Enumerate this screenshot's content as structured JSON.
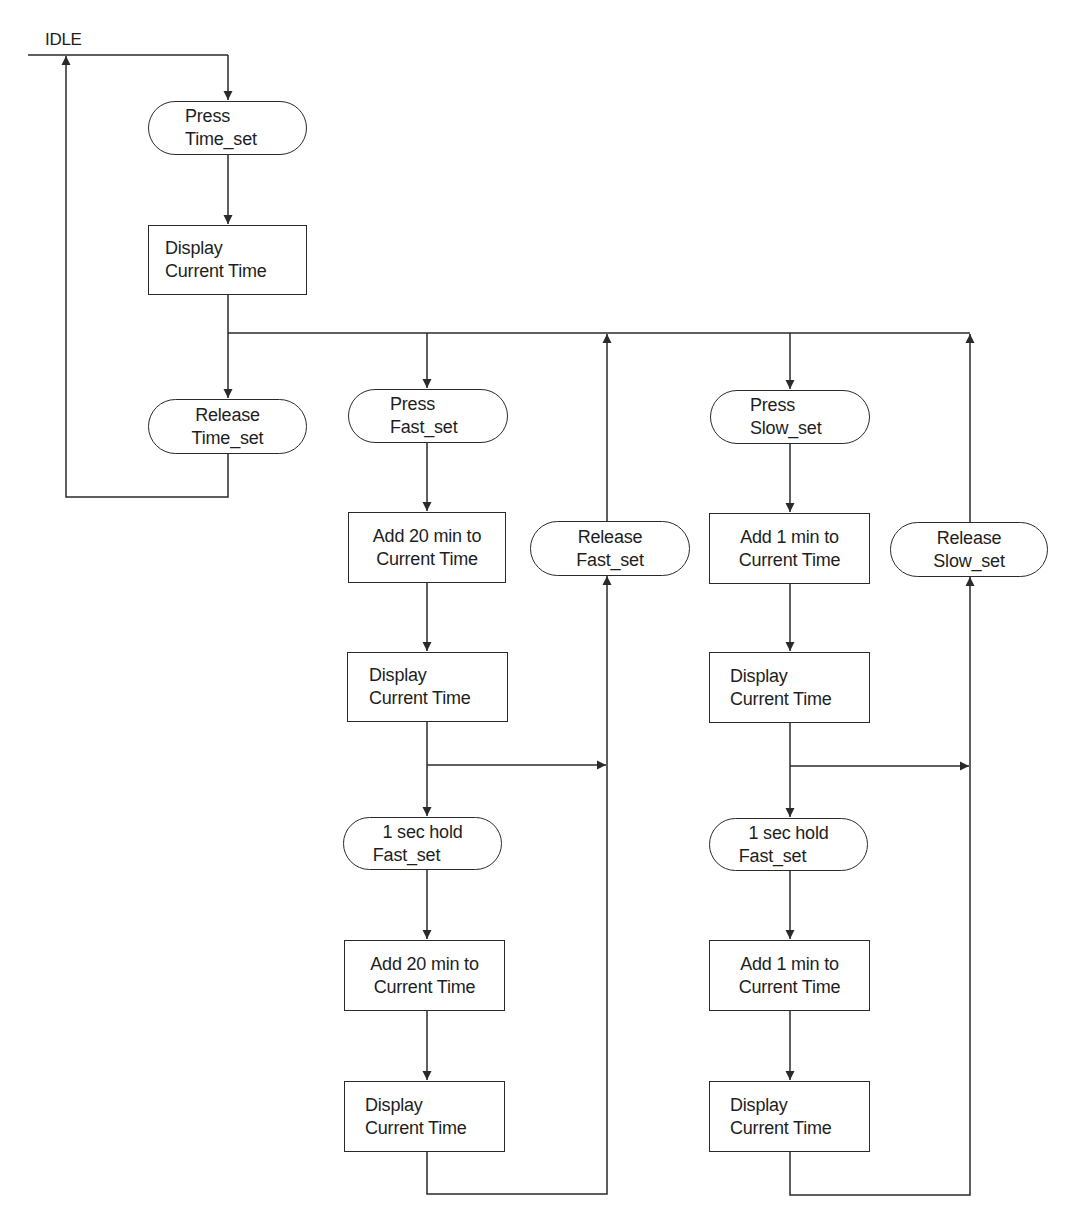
{
  "diagram": {
    "type": "flowchart",
    "title_cutoff_visible": false,
    "start_label": "IDLE",
    "colors": {
      "line": "#2a2a2a",
      "text": "#1e1e1e",
      "background": "#ffffff"
    },
    "time_set_column": {
      "press": {
        "shape": "terminator",
        "lines": [
          "Press",
          "Time_set"
        ]
      },
      "display": {
        "shape": "process",
        "lines": [
          "Display",
          "Current Time"
        ]
      },
      "release": {
        "shape": "terminator",
        "lines": [
          "Release",
          "Time_set"
        ]
      }
    },
    "fast_set_column": {
      "press": {
        "shape": "terminator",
        "lines": [
          "Press",
          "Fast_set"
        ]
      },
      "add_1": {
        "shape": "process",
        "lines": [
          "Add 20 min to",
          "Current Time"
        ]
      },
      "display_1": {
        "shape": "process",
        "lines": [
          "Display",
          "Current Time"
        ]
      },
      "hold": {
        "shape": "terminator",
        "lines": [
          "1 sec hold",
          "Fast_set"
        ]
      },
      "add_2": {
        "shape": "process",
        "lines": [
          "Add 20 min to",
          "Current Time"
        ]
      },
      "display_2": {
        "shape": "process",
        "lines": [
          "Display",
          "Current Time"
        ]
      },
      "release": {
        "shape": "terminator",
        "lines": [
          "Release",
          "Fast_set"
        ]
      }
    },
    "slow_set_column": {
      "press": {
        "shape": "terminator",
        "lines": [
          "Press",
          "Slow_set"
        ]
      },
      "add_1": {
        "shape": "process",
        "lines": [
          "Add 1 min to",
          "Current Time"
        ]
      },
      "display_1": {
        "shape": "process",
        "lines": [
          "Display",
          "Current Time"
        ]
      },
      "hold": {
        "shape": "terminator",
        "lines": [
          "1 sec hold",
          "Fast_set"
        ]
      },
      "add_2": {
        "shape": "process",
        "lines": [
          "Add 1 min to",
          "Current Time"
        ]
      },
      "display_2": {
        "shape": "process",
        "lines": [
          "Display",
          "Current Time"
        ]
      },
      "release": {
        "shape": "terminator",
        "lines": [
          "Release",
          "Slow_set"
        ]
      }
    },
    "edges": [
      {
        "from": "IDLE",
        "to": "Press Time_set"
      },
      {
        "from": "Press Time_set",
        "to": "Display Current Time"
      },
      {
        "from": "Display Current Time",
        "to": "Release Time_set"
      },
      {
        "from": "Display Current Time",
        "to": "Press Fast_set"
      },
      {
        "from": "Display Current Time",
        "to": "Press Slow_set"
      },
      {
        "from": "Release Time_set",
        "to": "IDLE"
      },
      {
        "from": "Press Fast_set",
        "to": "Add 20 min to Current Time"
      },
      {
        "from": "Add 20 min to Current Time",
        "to": "Display Current Time (fast 1)"
      },
      {
        "from": "Display Current Time (fast 1)",
        "to": "1 sec hold Fast_set"
      },
      {
        "from": "Display Current Time (fast 1)",
        "to": "Release Fast_set"
      },
      {
        "from": "1 sec hold Fast_set",
        "to": "Add 20 min to Current Time (2)"
      },
      {
        "from": "Add 20 min to Current Time (2)",
        "to": "Display Current Time (fast 2)"
      },
      {
        "from": "Display Current Time (fast 2)",
        "to": "Release Fast_set"
      },
      {
        "from": "Release Fast_set",
        "to": "bus (Display Current Time)"
      },
      {
        "from": "Press Slow_set",
        "to": "Add 1 min to Current Time"
      },
      {
        "from": "Add 1 min to Current Time",
        "to": "Display Current Time (slow 1)"
      },
      {
        "from": "Display Current Time (slow 1)",
        "to": "1 sec hold Fast_set (slow column)"
      },
      {
        "from": "Display Current Time (slow 1)",
        "to": "Release Slow_set"
      },
      {
        "from": "1 sec hold Fast_set (slow column)",
        "to": "Add 1 min to Current Time (2)"
      },
      {
        "from": "Add 1 min to Current Time (2)",
        "to": "Display Current Time (slow 2)"
      },
      {
        "from": "Display Current Time (slow 2)",
        "to": "Release Slow_set"
      },
      {
        "from": "Release Slow_set",
        "to": "bus (Display Current Time)"
      }
    ]
  }
}
